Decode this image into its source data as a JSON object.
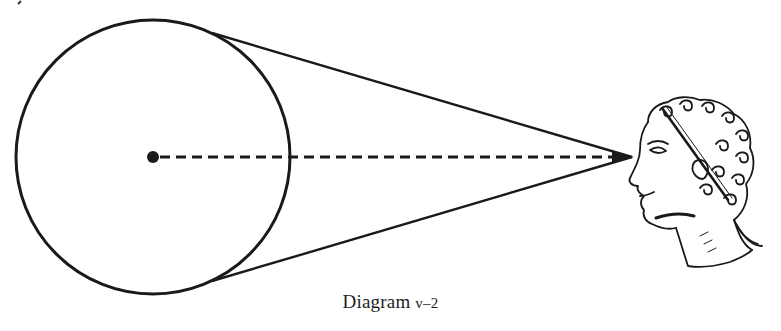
{
  "caption": {
    "prefix": "Diagram",
    "number": "v–2"
  },
  "figure": {
    "elements": [
      "circle",
      "center-point",
      "upper-tangent-line",
      "lower-tangent-line",
      "dashed-center-line",
      "observer-head-profile"
    ],
    "ink_color": "#1a1a1a",
    "background_color": "#ffffff"
  }
}
